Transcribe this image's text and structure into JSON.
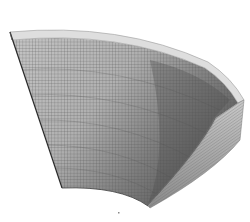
{
  "figure": {
    "description": "3D finite element mesh of a curved shell sector (doubly curved panel) with a visible thickness edge",
    "colors": {
      "background": "#ffffff",
      "mesh_light": "#b8b8b8",
      "mesh_mid": "#8c8c8c",
      "mesh_dark": "#5a5a5a",
      "rim": "#dcdcdc",
      "side_face": "#9a9a9a",
      "grid_line": "#4a4a4a"
    }
  }
}
